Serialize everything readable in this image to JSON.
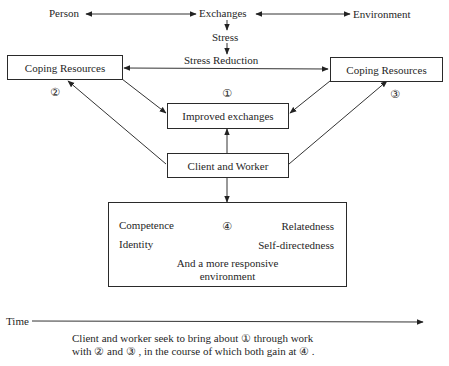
{
  "top_row": {
    "person": "Person",
    "exchanges": "Exchanges",
    "environment": "Environment"
  },
  "stress": "Stress",
  "stress_reduction": "Stress Reduction",
  "coping_left": {
    "label": "Coping Resources",
    "marker": "②"
  },
  "coping_right": {
    "label": "Coping Resources",
    "marker": "③"
  },
  "improved": {
    "label": "Improved exchanges",
    "marker": "①"
  },
  "client_worker": "Client and Worker",
  "outcome": {
    "marker": "④",
    "competence": "Competence",
    "relatedness": "Relatedness",
    "identity": "Identity",
    "self_directedness": "Self-directedness",
    "env_line1": "And a more responsive",
    "env_line2": "environment"
  },
  "time_label": "Time",
  "caption": {
    "line1": "Client and worker seek to bring about  ①  through work",
    "line2": "with ② and ③ , in the course of which both gain at ④ ."
  }
}
